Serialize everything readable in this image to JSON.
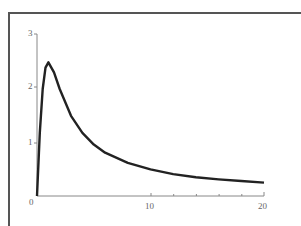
{
  "chart_data": {
    "type": "line",
    "title": "",
    "xlabel": "",
    "ylabel": "",
    "xlim": [
      0,
      20
    ],
    "ylim": [
      0,
      3
    ],
    "grid": false,
    "legend": null,
    "x_ticks": [
      "0",
      "10",
      "20"
    ],
    "y_ticks": [
      "1",
      "2",
      "3"
    ],
    "series": [
      {
        "name": "f(x)",
        "x": [
          0,
          0.25,
          0.5,
          0.75,
          1,
          1.5,
          2,
          3,
          4,
          5,
          6,
          8,
          10,
          12,
          14,
          16,
          18,
          20
        ],
        "values": [
          0,
          1.18,
          2.0,
          2.4,
          2.5,
          2.31,
          2.0,
          1.5,
          1.18,
          0.96,
          0.81,
          0.62,
          0.5,
          0.41,
          0.35,
          0.31,
          0.28,
          0.25
        ]
      }
    ]
  },
  "axes": {
    "x_labels": {
      "zero": "0",
      "ten": "10",
      "twenty": "20"
    },
    "y_labels": {
      "one": "1",
      "two": "2",
      "three": "3"
    }
  },
  "colors": {
    "curve": "#222222",
    "axis": "#888888",
    "frame": "#555555"
  }
}
